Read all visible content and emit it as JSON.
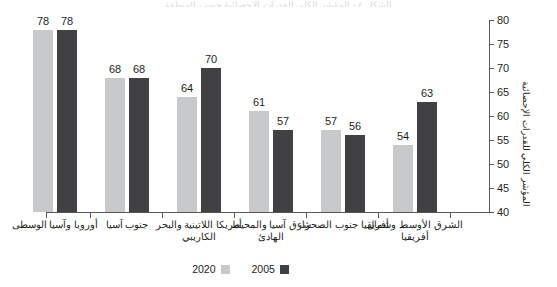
{
  "top_clip_text": "الشكل ٤ - المؤشر الكلي للقدرات الإحصائية حسب المنطقة",
  "chart_data": {
    "type": "bar",
    "title": "",
    "xlabel": "",
    "ylabel": "المؤشر الكلي للقدرات الإحصائية",
    "ylim": [
      40,
      80
    ],
    "yticks": [
      40,
      45,
      50,
      55,
      60,
      65,
      70,
      75,
      80
    ],
    "ytick_labels": [
      "40",
      "45",
      "50",
      "55",
      "60",
      "65",
      "70",
      "75",
      "80"
    ],
    "grid": false,
    "legend_position": "bottom",
    "direction": "rtl",
    "categories": [
      "أوروبا وآسيا الوسطى",
      "جنوب آسيا",
      "أمريكا اللاتينية والبحر الكاريبي",
      "شرق آسيا والمحيط الهادئ",
      "أفريقيا جنوب الصحراء",
      "الشرق الأوسط وشمال أفريقيا"
    ],
    "series": [
      {
        "name": "2020",
        "color": "#c8c9ca",
        "values": [
          78,
          68,
          64,
          61,
          57,
          54
        ]
      },
      {
        "name": "2005",
        "color": "#414042",
        "values": [
          78,
          68,
          70,
          57,
          56,
          63
        ]
      }
    ]
  },
  "legend": [
    {
      "label": "2020",
      "color": "#c8c9ca"
    },
    {
      "label": "2005",
      "color": "#414042"
    }
  ],
  "axis_colors": {
    "axis_line": "#58595b",
    "text": "#231f20",
    "background": "#ffffff"
  }
}
